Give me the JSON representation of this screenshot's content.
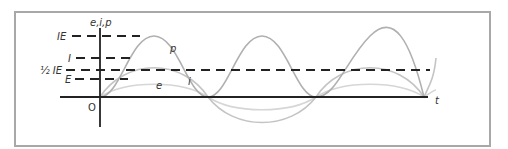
{
  "figure": {
    "axis_labels": {
      "y": "e,i,p",
      "x": "t",
      "origin": "O"
    },
    "level_labels": {
      "IE": "IE",
      "I": "I",
      "half_IE": "½ IE",
      "E": "E"
    },
    "curve_labels": {
      "p": "p",
      "i": "i",
      "e": "e"
    },
    "colors": {
      "frame": "#a8a8a8",
      "axes": "#222222",
      "dash": "#222222",
      "p": "#b0b0b0",
      "i": "#c4c4c4",
      "e": "#d6d6d6"
    }
  }
}
